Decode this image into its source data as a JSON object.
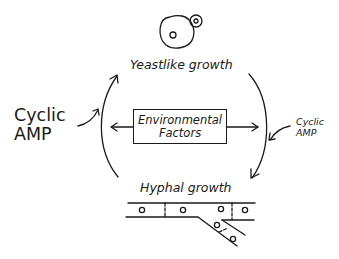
{
  "diagram": {
    "nodes": {
      "yeast": {
        "label": "Yeastlike growth",
        "icon": "budding-yeast-cell"
      },
      "hyphal": {
        "label": "Hyphal growth",
        "icon": "branching-hypha"
      },
      "environment": {
        "line1": "Environmental",
        "line2": "Factors"
      }
    },
    "modulators": {
      "left": {
        "line1": "Cyclic",
        "line2": "AMP",
        "target": "hyphal-to-yeast transition"
      },
      "right": {
        "line1": "Cyclic",
        "line2": "AMP",
        "target": "yeast-to-hyphal transition"
      }
    },
    "edges": [
      {
        "from": "Hyphal growth",
        "to": "Yeastlike growth",
        "side": "left"
      },
      {
        "from": "Yeastlike growth",
        "to": "Hyphal growth",
        "side": "right"
      },
      {
        "from": "Environmental Factors",
        "to": "left arc"
      },
      {
        "from": "Environmental Factors",
        "to": "right arc"
      }
    ],
    "colors": {
      "ink": "#1a1a1a",
      "background": "#ffffff"
    }
  }
}
